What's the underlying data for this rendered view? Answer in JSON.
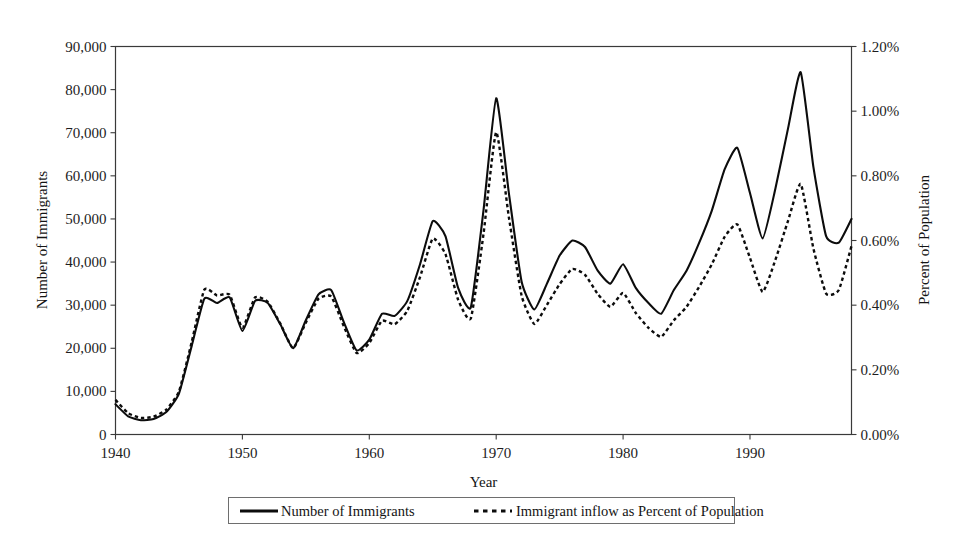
{
  "chart_data": {
    "type": "line",
    "title": "",
    "xlabel": "Year",
    "ylabel": "Number of Immigrants",
    "y2label": "Percent of Population",
    "xlim": [
      1940,
      1998
    ],
    "ylim": [
      0,
      90000
    ],
    "y2lim": [
      0,
      0.012
    ],
    "grid": false,
    "legend_position": "bottom",
    "xticks": [
      1940,
      1950,
      1960,
      1970,
      1980,
      1990
    ],
    "xtick_labels": [
      "1940",
      "1950",
      "1960",
      "1970",
      "1980",
      "1990"
    ],
    "yticks": [
      0,
      10000,
      20000,
      30000,
      40000,
      50000,
      60000,
      70000,
      80000,
      90000
    ],
    "ytick_labels": [
      "0",
      "10,000",
      "20,000",
      "30,000",
      "40,000",
      "50,000",
      "60,000",
      "70,000",
      "80,000",
      "90,000"
    ],
    "y2ticks": [
      0,
      0.002,
      0.004,
      0.006,
      0.008,
      0.01,
      0.012
    ],
    "y2tick_labels": [
      "0.00%",
      "0.20%",
      "0.40%",
      "0.60%",
      "0.80%",
      "1.00%",
      "1.20%"
    ],
    "x": [
      1940,
      1941,
      1942,
      1943,
      1944,
      1945,
      1946,
      1947,
      1948,
      1949,
      1950,
      1951,
      1952,
      1953,
      1954,
      1955,
      1956,
      1957,
      1958,
      1959,
      1960,
      1961,
      1962,
      1963,
      1964,
      1965,
      1966,
      1967,
      1968,
      1969,
      1970,
      1971,
      1972,
      1973,
      1974,
      1975,
      1976,
      1977,
      1978,
      1979,
      1980,
      1981,
      1982,
      1983,
      1984,
      1985,
      1986,
      1987,
      1988,
      1989,
      1990,
      1991,
      1992,
      1993,
      1994,
      1995,
      1996,
      1997,
      1998
    ],
    "series": [
      {
        "name": "Number of Immigrants",
        "style": "solid",
        "axis": "left",
        "units": "immigrants",
        "values": [
          7000,
          4200,
          3300,
          3600,
          5200,
          9500,
          20500,
          31500,
          30500,
          31800,
          24000,
          31000,
          30500,
          25500,
          20000,
          26500,
          32500,
          33500,
          26000,
          19500,
          22000,
          28000,
          27500,
          31000,
          39500,
          49500,
          46000,
          34000,
          29500,
          52000,
          78000,
          56000,
          35500,
          29000,
          35000,
          41500,
          45000,
          43500,
          38000,
          35000,
          39500,
          34000,
          30500,
          28000,
          33500,
          38000,
          44500,
          52000,
          61500,
          66500,
          56000,
          45500,
          57000,
          71000,
          84000,
          62000,
          46000,
          44500,
          50000
        ]
      },
      {
        "name": "Immigrant inflow as Percent of Population",
        "style": "dashed",
        "axis": "right",
        "units": "percent_of_population",
        "values": [
          0.00107,
          0.00066,
          0.00051,
          0.00055,
          0.00077,
          0.00133,
          0.00285,
          0.00448,
          0.0043,
          0.00432,
          0.0033,
          0.00424,
          0.0041,
          0.00342,
          0.00267,
          0.00346,
          0.0042,
          0.00427,
          0.00334,
          0.00252,
          0.00283,
          0.00352,
          0.00341,
          0.00383,
          0.00487,
          0.00606,
          0.00558,
          0.00417,
          0.00359,
          0.0062,
          0.00935,
          0.00672,
          0.0043,
          0.00342,
          0.00401,
          0.00465,
          0.00512,
          0.00494,
          0.00435,
          0.00395,
          0.00438,
          0.00376,
          0.0033,
          0.00302,
          0.00353,
          0.00395,
          0.00457,
          0.00527,
          0.00611,
          0.0065,
          0.00546,
          0.00441,
          0.0054,
          0.00661,
          0.00775,
          0.00575,
          0.00436,
          0.00447,
          0.00583
        ]
      }
    ]
  },
  "axes": {
    "x_title": "Year",
    "y_left_title": "Number of Immigrants",
    "y_right_title": "Percent of Population"
  },
  "legend": {
    "items": [
      {
        "label": "Number of Immigrants",
        "style": "solid"
      },
      {
        "label": "Immigrant inflow as Percent of Population",
        "style": "dashed"
      }
    ]
  },
  "colors": {
    "line": "#0c0c0c",
    "axis": "#3a3a3a",
    "text": "#141414",
    "background": "#ffffff"
  }
}
